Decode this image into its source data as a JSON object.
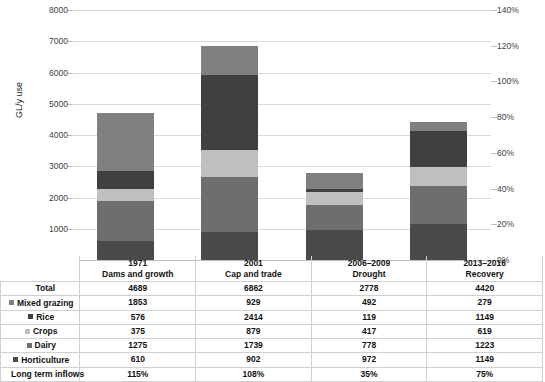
{
  "chart_data": {
    "type": "bar",
    "subtype": "stacked-column",
    "title": "",
    "xlabel": "",
    "ylabel": "GL/y use",
    "ylim": [
      0,
      8000
    ],
    "ytick_step": 1000,
    "yticks": [
      "0",
      "1000",
      "2000",
      "3000",
      "4000",
      "5000",
      "6000",
      "7000",
      "8000"
    ],
    "y2label": "",
    "y2lim": [
      0,
      140
    ],
    "y2tick_step": 20,
    "y2ticks": [
      "0%",
      "20%",
      "40%",
      "60%",
      "80%",
      "100%",
      "120%",
      "140%"
    ],
    "grid": true,
    "legend": "table-row-markers",
    "categories": [
      {
        "period": "1971",
        "name": "Dams and growth"
      },
      {
        "period": "2001",
        "name": "Cap and trade"
      },
      {
        "period": "2006–2009",
        "name": "Drought"
      },
      {
        "period": "2013–2016",
        "name": "Recovery"
      }
    ],
    "stack_order_bottom_up": [
      "Horticulture",
      "Dairy",
      "Crops",
      "Rice",
      "Mixed grazing"
    ],
    "series": [
      {
        "name": "Mixed grazing",
        "color": "#808080",
        "values": [
          1853,
          929,
          492,
          279
        ]
      },
      {
        "name": "Rice",
        "color": "#404040",
        "values": [
          576,
          2414,
          119,
          1149
        ]
      },
      {
        "name": "Crops",
        "color": "#bfbfbf",
        "values": [
          375,
          879,
          417,
          619
        ]
      },
      {
        "name": "Dairy",
        "color": "#6e6e6e",
        "values": [
          1275,
          1739,
          778,
          1223
        ]
      },
      {
        "name": "Horticulture",
        "color": "#4a4a4a",
        "values": [
          610,
          902,
          972,
          1149
        ]
      }
    ],
    "totals": {
      "name": "Total",
      "values": [
        4689,
        6862,
        2778,
        4420
      ]
    },
    "secondary_series": {
      "name": "Long term inflows",
      "values": [
        "115%",
        "108%",
        "35%",
        "75%"
      ]
    }
  },
  "table": {
    "row_label_header": "",
    "rows": [
      {
        "label": "Total",
        "marker": false,
        "values": [
          "4689",
          "6862",
          "2778",
          "4420"
        ]
      },
      {
        "label": "Mixed grazing",
        "marker": true,
        "color": "#808080",
        "values": [
          "1853",
          "929",
          "492",
          "279"
        ]
      },
      {
        "label": "Rice",
        "marker": true,
        "color": "#404040",
        "values": [
          "576",
          "2414",
          "119",
          "1149"
        ]
      },
      {
        "label": "Crops",
        "marker": true,
        "color": "#bfbfbf",
        "values": [
          "375",
          "879",
          "417",
          "619"
        ]
      },
      {
        "label": "Dairy",
        "marker": true,
        "color": "#6e6e6e",
        "values": [
          "1275",
          "1739",
          "778",
          "1223"
        ]
      },
      {
        "label": "Horticulture",
        "marker": true,
        "color": "#4a4a4a",
        "values": [
          "610",
          "902",
          "972",
          "1149"
        ]
      },
      {
        "label": "Long term inflows",
        "marker": false,
        "values": [
          "115%",
          "108%",
          "35%",
          "75%"
        ]
      }
    ]
  },
  "colors": {
    "gridline": "#d9d9d9",
    "axis": "#bfbfbf",
    "text": "#1a1a1a",
    "table_border": "#d0d0d0"
  }
}
